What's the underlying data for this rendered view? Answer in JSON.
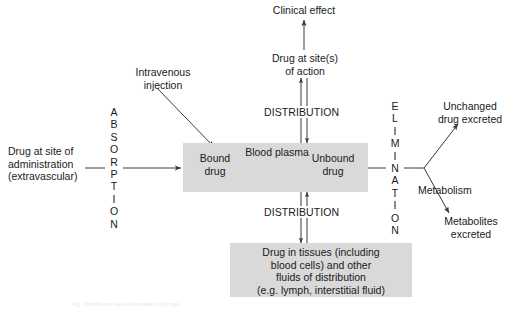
{
  "diagram": {
    "colors": {
      "box_fill": "#d9d9d9",
      "line": "#3a3a3a",
      "text": "#1a1a1a",
      "background": "#ffffff"
    },
    "nodes": {
      "administration": "Drug at site of\nadministration\n(extravascular)",
      "intravenous": "Intravenous\ninjection",
      "bound_drug": "Bound\ndrug",
      "unbound_drug": "Unbound\ndrug",
      "blood_plasma": "Blood plasma",
      "site_of_action": "Drug at site(s)\nof action",
      "clinical_effect": "Clinical effect",
      "tissues": "Drug in tissues (including\nblood cells) and other\nfluids of distribution\n(e.g. lymph, interstitial fluid)",
      "unchanged": "Unchanged\ndrug excreted",
      "metabolism": "Metabolism",
      "metabolites": "Metabolites\nexcreted"
    },
    "process_labels": {
      "absorption": "ABSORPTION",
      "elimination": "ELIMINATION",
      "distribution_upper": "DISTRIBUTION",
      "distribution_lower": "DISTRIBUTION"
    },
    "vertical_letters": {
      "absorption": [
        "A",
        "B",
        "S",
        "O",
        "R",
        "P",
        "T",
        "I",
        "O",
        "N"
      ],
      "elimination": [
        "E",
        "L",
        "I",
        "M",
        "I",
        "N",
        "A",
        "T",
        "I",
        "O",
        "N"
      ]
    },
    "caption": "Fig. Distribution and elimination of drugs"
  }
}
